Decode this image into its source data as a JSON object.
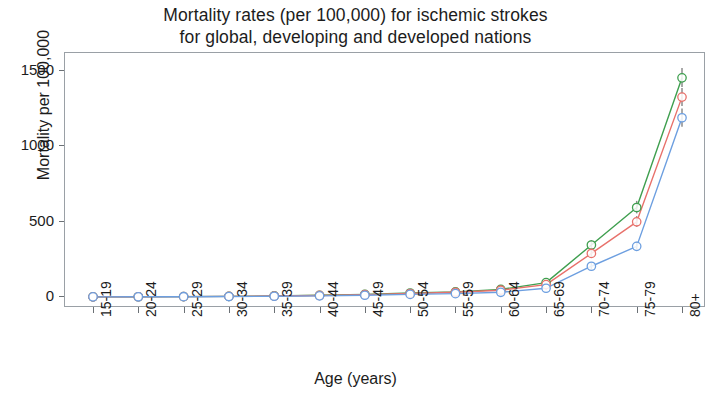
{
  "title": "Mortality rates (per 100,000) for ischemic strokes\nfor global, developing and developed nations",
  "chart_data": {
    "type": "line",
    "title": "Mortality rates (per 100,000) for ischemic strokes for global, developing and developed nations",
    "xlabel": "Age (years)",
    "ylabel": "Mortality per 100,000",
    "categories": [
      "15-19",
      "20-24",
      "25-29",
      "30-34",
      "35-39",
      "40-44",
      "45-49",
      "50-54",
      "55-59",
      "60-64",
      "65-69",
      "70-74",
      "75-79",
      "80+"
    ],
    "ylim": [
      -60,
      1620
    ],
    "yticks": [
      0,
      500,
      1000,
      1500
    ],
    "ytick_labels": [
      "0",
      "500",
      "1000",
      "1500"
    ],
    "grid": false,
    "legend": "none",
    "error_bars": true,
    "series": [
      {
        "name": "developing",
        "color": "#3f9f4f",
        "values": [
          1.0,
          1.5,
          2.5,
          4.0,
          7.0,
          11.0,
          17.0,
          26.0,
          34.0,
          50.0,
          95.0,
          345.0,
          594.0,
          1455.0
        ],
        "err_low": [
          0.5,
          1.0,
          1.5,
          3.0,
          5.0,
          8.0,
          13.0,
          20.0,
          27.0,
          40.0,
          80.0,
          315.0,
          555.0,
          1395.0
        ],
        "err_high": [
          1.8,
          2.5,
          3.5,
          6.0,
          10.0,
          15.0,
          22.0,
          33.0,
          43.0,
          62.0,
          113.0,
          378.0,
          638.0,
          1520.0
        ]
      },
      {
        "name": "global",
        "color": "#e8716b",
        "values": [
          0.9,
          1.3,
          2.2,
          3.6,
          6.2,
          10.0,
          15.5,
          23.0,
          31.0,
          45.0,
          82.0,
          289.0,
          499.0,
          1327.0
        ],
        "err_low": [
          0.4,
          0.8,
          1.3,
          2.6,
          4.5,
          7.0,
          12.0,
          18.0,
          25.0,
          36.0,
          70.0,
          262.0,
          466.0,
          1268.0
        ],
        "err_high": [
          1.6,
          2.2,
          3.2,
          5.4,
          9.0,
          14.0,
          20.0,
          29.0,
          39.0,
          56.0,
          98.0,
          320.0,
          537.0,
          1388.0
        ]
      },
      {
        "name": "developed",
        "color": "#6d9fe0",
        "values": [
          0.8,
          1.1,
          1.8,
          2.9,
          4.8,
          7.5,
          11.5,
          17.0,
          22.0,
          31.0,
          58.0,
          204.0,
          336.0,
          1190.0
        ],
        "err_low": [
          0.3,
          0.6,
          1.0,
          2.0,
          3.4,
          5.5,
          9.0,
          13.5,
          18.0,
          25.0,
          48.0,
          183.0,
          311.0,
          1130.0
        ],
        "err_high": [
          1.4,
          1.8,
          2.7,
          4.2,
          6.8,
          10.5,
          15.0,
          21.5,
          28.0,
          40.0,
          72.0,
          229.0,
          366.0,
          1252.0
        ]
      }
    ]
  }
}
